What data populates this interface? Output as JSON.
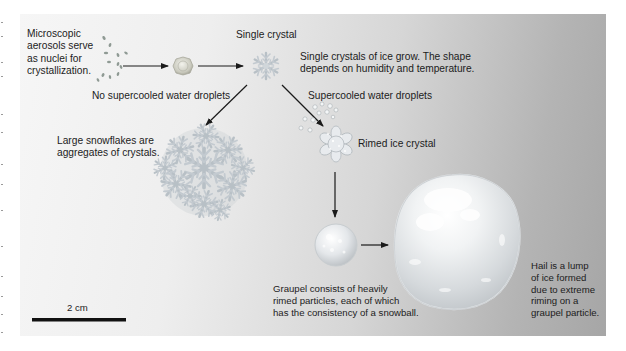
{
  "labels": {
    "aerosols": "Microscopic\naerosols serve\nas nuclei for\ncrystallization.",
    "single_crystal": "Single crystal",
    "single_crystal_desc": "Single crystals of ice grow. The shape\ndepends on humidity and temperature.",
    "no_supercooled": "No supercooled water droplets",
    "supercooled": "Supercooled water droplets",
    "snowflakes": "Large snowflakes are\naggregates of crystals.",
    "rimed": "Rimed ice crystal",
    "graupel": "Graupel consists of heavily\nrimed particles, each of which\nhas the consistency of a snowball.",
    "hail": "Hail is a lump\nof ice formed\ndue to extreme\nriming on a\ngraupel particle."
  },
  "scale_bar": {
    "label": "2 cm"
  },
  "stages": [
    {
      "id": "aerosol-nuclei",
      "icon": "aerosol-particles"
    },
    {
      "id": "nucleated-particle",
      "icon": "ice-nucleus"
    },
    {
      "id": "single-crystal",
      "icon": "snowflake-crystal"
    },
    {
      "id": "snowflake-aggregate",
      "icon": "snowflake-aggregate"
    },
    {
      "id": "supercooled-droplets",
      "icon": "water-droplets"
    },
    {
      "id": "rimed-crystal",
      "icon": "rimed-crystal"
    },
    {
      "id": "graupel",
      "icon": "graupel-pellet"
    },
    {
      "id": "hailstone",
      "icon": "hailstone"
    }
  ],
  "colors": {
    "text": "#1c1c1c",
    "arrow": "#1a1a1a",
    "ice": "#e9ecef",
    "ice_shadow": "#9ea4a8"
  }
}
